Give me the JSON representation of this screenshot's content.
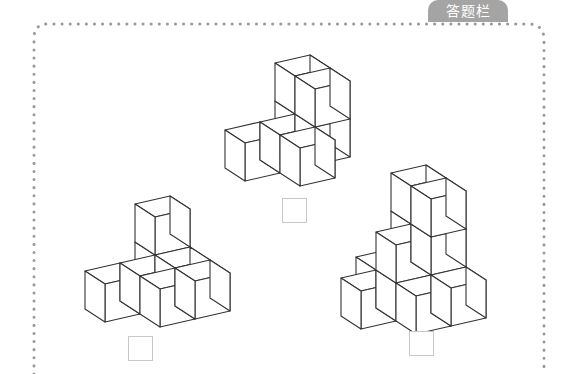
{
  "header": {
    "label": "答题栏"
  },
  "colors": {
    "border_dots": "#9a9a9a",
    "label_bg": "#a4a4a4",
    "cube_stroke": "#333333",
    "cube_fill": "#ffffff",
    "answer_box_border": "#c8c8c8"
  },
  "projection": {
    "right": [
      35,
      -8
    ],
    "forward": [
      20,
      13
    ],
    "up": [
      0,
      -38
    ]
  },
  "figures": [
    {
      "name": "figure-top",
      "origin": [
        205,
        155
      ],
      "cubes": [
        [
          2,
          0,
          0
        ],
        [
          2,
          0,
          1
        ],
        [
          2,
          1,
          0
        ],
        [
          2,
          1,
          1
        ],
        [
          0,
          1,
          0
        ],
        [
          1,
          1,
          0
        ],
        [
          1,
          2,
          0
        ]
      ],
      "answer_box": {
        "x": 282,
        "y": 198,
        "value": ""
      }
    },
    {
      "name": "figure-bottom-left",
      "origin": [
        65,
        296
      ],
      "cubes": [
        [
          2,
          0,
          0
        ],
        [
          2,
          0,
          1
        ],
        [
          0,
          1,
          0
        ],
        [
          1,
          1,
          0
        ],
        [
          2,
          1,
          0
        ],
        [
          1,
          2,
          0
        ],
        [
          2,
          2,
          0
        ]
      ],
      "answer_box": {
        "x": 128,
        "y": 336,
        "value": ""
      }
    },
    {
      "name": "figure-bottom-right",
      "origin": [
        321,
        303
      ],
      "cubes": [
        [
          2,
          0,
          0
        ],
        [
          2,
          0,
          1
        ],
        [
          2,
          0,
          2
        ],
        [
          2,
          1,
          0
        ],
        [
          2,
          1,
          1
        ],
        [
          2,
          1,
          2
        ],
        [
          1,
          0,
          0
        ],
        [
          1,
          1,
          0
        ],
        [
          1,
          1,
          1
        ],
        [
          0,
          1,
          0
        ],
        [
          1,
          2,
          0
        ],
        [
          2,
          2,
          0
        ]
      ],
      "answer_box": {
        "x": 409,
        "y": 331,
        "value": ""
      }
    }
  ]
}
